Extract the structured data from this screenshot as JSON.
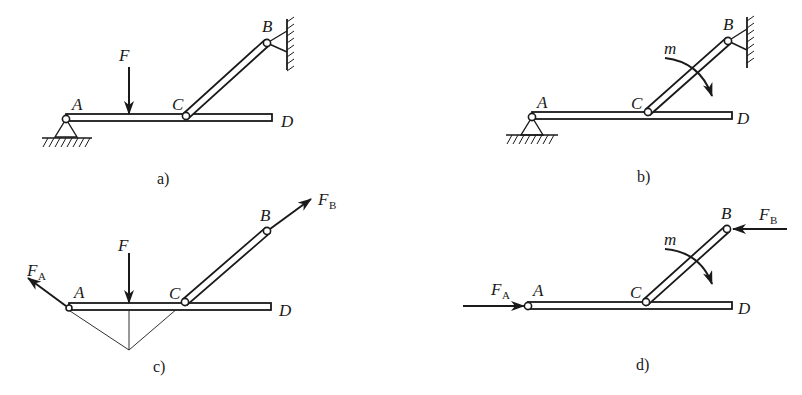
{
  "figure": {
    "width": 802,
    "height": 395,
    "ink_color": "#1a1a1a",
    "background": "#ffffff"
  },
  "panels": [
    {
      "id": "a",
      "caption": "a)",
      "caption_pos": [
        157,
        184
      ],
      "points": {
        "A": [
          66,
          119
        ],
        "C": [
          186,
          116
        ],
        "B": [
          267,
          43
        ],
        "D_end": [
          272,
          118
        ]
      },
      "labels": [
        {
          "text": "A",
          "pos": [
            72,
            110
          ]
        },
        {
          "text": "C",
          "pos": [
            172,
            110
          ]
        },
        {
          "text": "B",
          "pos": [
            262,
            32
          ]
        },
        {
          "text": "D",
          "pos": [
            281,
            127
          ]
        },
        {
          "text": "F",
          "pos": [
            119,
            61
          ]
        }
      ],
      "forces": [
        {
          "name": "F",
          "from": [
            129,
            67
          ],
          "to": [
            129,
            114
          ]
        }
      ],
      "supports": [
        "fixed-pin-ground-at-A",
        "fixed-pin-wall-at-B"
      ]
    },
    {
      "id": "b",
      "caption": "b)",
      "caption_pos": [
        637,
        182
      ],
      "points": {
        "A": [
          532,
          117
        ],
        "C": [
          648,
          112
        ],
        "B": [
          728,
          41
        ],
        "D_end": [
          732,
          116
        ]
      },
      "labels": [
        {
          "text": "A",
          "pos": [
            537,
            108
          ]
        },
        {
          "text": "C",
          "pos": [
            631,
            109
          ]
        },
        {
          "text": "B",
          "pos": [
            723,
            30
          ]
        },
        {
          "text": "D",
          "pos": [
            737,
            124
          ]
        },
        {
          "text": "m",
          "pos": [
            664,
            54
          ]
        }
      ],
      "couples": [
        {
          "name": "m",
          "direction": "clockwise",
          "center": [
            690,
            72
          ]
        }
      ],
      "supports": [
        "fixed-pin-ground-at-A",
        "fixed-pin-wall-at-B"
      ]
    },
    {
      "id": "c",
      "caption": "c)",
      "caption_pos": [
        153,
        372
      ],
      "points": {
        "A": [
          69,
          308
        ],
        "C": [
          185,
          302
        ],
        "B": [
          267,
          231
        ],
        "D_end": [
          271,
          307
        ]
      },
      "labels": [
        {
          "text": "A",
          "pos": [
            74,
            298
          ]
        },
        {
          "text": "C",
          "pos": [
            169,
            299
          ]
        },
        {
          "text": "B",
          "pos": [
            260,
            221
          ]
        },
        {
          "text": "D",
          "pos": [
            279,
            316
          ]
        },
        {
          "text": "F",
          "pos": [
            118,
            251
          ]
        }
      ],
      "forces": [
        {
          "name": "F",
          "from": [
            129,
            253
          ],
          "to": [
            129,
            303
          ]
        },
        {
          "name": "F_A",
          "from": [
            68,
            308
          ],
          "to": [
            28,
            278
          ]
        },
        {
          "name": "F_B",
          "from": [
            268,
            231
          ],
          "to": [
            311,
            199
          ]
        }
      ],
      "force_labels": [
        {
          "main": "F",
          "sub": "A",
          "pos": [
            27,
            276
          ]
        },
        {
          "main": "F",
          "sub": "B",
          "pos": [
            318,
            205
          ]
        }
      ],
      "three_force_lines": {
        "concurrency_point": [
          129,
          350
        ]
      }
    },
    {
      "id": "d",
      "caption": "d)",
      "caption_pos": [
        636,
        370
      ],
      "points": {
        "A": [
          528,
          306
        ],
        "C": [
          646,
          302
        ],
        "B": [
          727,
          229
        ],
        "D_end": [
          732,
          306
        ]
      },
      "labels": [
        {
          "text": "A",
          "pos": [
            533,
            296
          ]
        },
        {
          "text": "C",
          "pos": [
            630,
            298
          ]
        },
        {
          "text": "B",
          "pos": [
            721,
            219
          ]
        },
        {
          "text": "D",
          "pos": [
            738,
            314
          ]
        },
        {
          "text": "m",
          "pos": [
            664,
            245
          ]
        }
      ],
      "forces": [
        {
          "name": "F_A",
          "from": [
            463,
            306
          ],
          "to": [
            524,
            306
          ]
        },
        {
          "name": "F_B",
          "from": [
            787,
            229
          ],
          "to": [
            734,
            229
          ]
        }
      ],
      "force_labels": [
        {
          "main": "F",
          "sub": "A",
          "pos": [
            491,
            295
          ]
        },
        {
          "main": "F",
          "sub": "B",
          "pos": [
            759,
            220
          ]
        }
      ],
      "couples": [
        {
          "name": "m",
          "direction": "clockwise",
          "center": [
            690,
            262
          ]
        }
      ]
    }
  ]
}
